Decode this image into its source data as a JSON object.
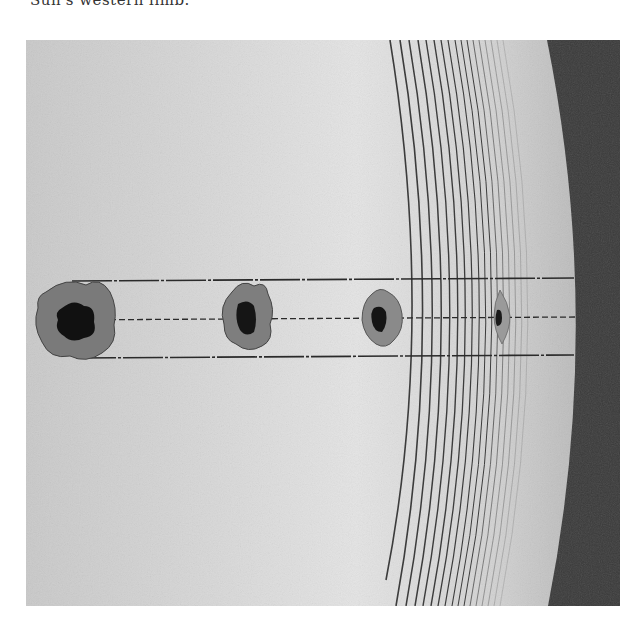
{
  "caption": {
    "text": "Sun's western limb."
  },
  "figure": {
    "colors": {
      "photosphere_light": "#dcdcdc",
      "photosphere_mid": "#bdbdbd",
      "space": "#3a3a3a",
      "penumbra": "#7a7a7a",
      "umbra": "#111111",
      "guide_line": "#2a2a2a"
    },
    "sunspots": [
      {
        "id": 1,
        "cx": 50,
        "cy": 281,
        "rx": 38,
        "ry": 38,
        "umbra_rx": 18,
        "umbra_ry": 17,
        "shape": "round"
      },
      {
        "id": 2,
        "cx": 221,
        "cy": 276,
        "rx": 26,
        "ry": 33,
        "umbra_rx": 10,
        "umbra_ry": 14,
        "shape": "oval"
      },
      {
        "id": 3,
        "cx": 357,
        "cy": 278,
        "rx": 21,
        "ry": 30,
        "umbra_rx": 7,
        "umbra_ry": 12,
        "shape": "foreshortened"
      },
      {
        "id": 4,
        "cx": 475,
        "cy": 276,
        "rx": 8,
        "ry": 27,
        "umbra_rx": 4,
        "umbra_ry": 9,
        "shape": "edge-on"
      }
    ],
    "guide_lines": [
      "top",
      "center",
      "bottom"
    ],
    "limb": {
      "top_x": 521,
      "mid_x": 550,
      "bottom_x": 522
    }
  }
}
